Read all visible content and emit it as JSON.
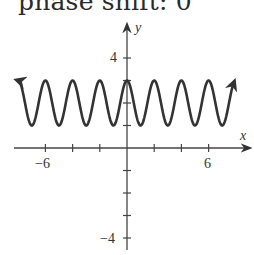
{
  "caption": "phase shift: 0",
  "chart_data": {
    "type": "line",
    "title": "phase shift: 0",
    "function": "y = 2 + cos(πx)",
    "xlabel": "x",
    "ylabel": "y",
    "xlim": [
      -8,
      7.85
    ],
    "ylim": [
      -4.5,
      5.5
    ],
    "x_ticks": [
      -6,
      -4,
      -2,
      2,
      4,
      6
    ],
    "x_tick_labels": [
      "-6",
      "6"
    ],
    "y_ticks": [
      -4,
      -3,
      -2,
      -1,
      1,
      2,
      3,
      4
    ],
    "y_tick_labels": [
      "4",
      "-4"
    ],
    "grid": false,
    "series": [
      {
        "name": "y = 2 + cos(πx)",
        "x": [
          -8,
          -7,
          -6,
          -5,
          -4,
          -3,
          -2,
          -1,
          0,
          1,
          2,
          3,
          4,
          5,
          6,
          7,
          7.85
        ],
        "values": [
          3,
          1,
          3,
          1,
          3,
          1,
          3,
          1,
          3,
          1,
          3,
          1,
          3,
          1,
          3,
          1,
          2.89
        ]
      }
    ],
    "amplitude": 1,
    "period": 2,
    "vertical_shift": 2,
    "phase_shift": 0,
    "line_color": "#333333",
    "arrows_on_both_ends": true
  },
  "labels": {
    "x_axis": "x",
    "y_axis": "y",
    "x_neg6": "−6",
    "x_pos6": "6",
    "y_pos4": "4",
    "y_neg4": "−4"
  }
}
